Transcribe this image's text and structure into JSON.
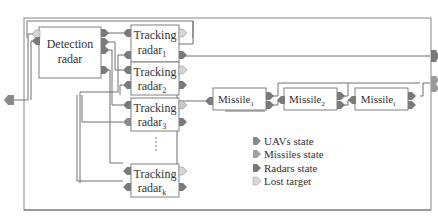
{
  "diagram": {
    "blocks": {
      "detection_radar": {
        "line1": "Detection",
        "line2": "radar"
      },
      "tracking_radar_1": {
        "line1": "Tracking",
        "line2": "radar",
        "sub": "1"
      },
      "tracking_radar_2": {
        "line1": "Tracking",
        "line2": "radar",
        "sub": "2"
      },
      "tracking_radar_3": {
        "line1": "Tracking",
        "line2": "radar",
        "sub": "3"
      },
      "tracking_radar_k": {
        "line1": "Tracking",
        "line2": "radar",
        "sub": "k"
      },
      "missile_1": {
        "label": "Missile",
        "sub": "1"
      },
      "missile_2": {
        "label": "Missile",
        "sub": "2"
      },
      "missile_i": {
        "label": "Missile",
        "sub": "i"
      }
    },
    "legend": [
      {
        "label": "UAVs state",
        "color": "#8a8a8a"
      },
      {
        "label": "Missiles state",
        "color": "#a0a0a0"
      },
      {
        "label": "Radars state",
        "color": "#777777"
      },
      {
        "label": "Lost target",
        "color": "#d8d8d8"
      }
    ],
    "colors": {
      "line": "#707070",
      "block_border": "#808080",
      "port_dark": "#7a7a7a",
      "port_light": "#d5d5d5"
    }
  }
}
